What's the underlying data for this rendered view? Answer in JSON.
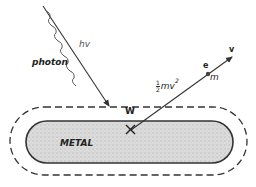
{
  "diagram": {
    "type": "photoelectric-effect",
    "labels": {
      "photon": "photon",
      "photon_energy": "hv",
      "metal": "METAL",
      "work_function": "W",
      "electron": "e",
      "mass": "m",
      "velocity": "v",
      "kinetic_energy_coeff_num": "1",
      "kinetic_energy_coeff_den": "2",
      "kinetic_energy_body": "mv",
      "kinetic_energy_exp": "2"
    },
    "colors": {
      "line": "#333333",
      "metal_fill": "#d6d6d6",
      "background": "#ffffff"
    }
  }
}
